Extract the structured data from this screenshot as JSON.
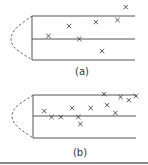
{
  "chart_data": [
    {
      "type": "scatter",
      "label": "(a)",
      "description": "Points relative to a central band; y normalized so upper line = 1, center line = 0, lower line = -1; x normalized to band length (0..1)",
      "band_lines": [
        1,
        0,
        -1
      ],
      "marker": "x",
      "points": [
        {
          "x": 0.91,
          "y": 1.45
        },
        {
          "x": 0.36,
          "y": 0.59
        },
        {
          "x": 0.62,
          "y": 0.77
        },
        {
          "x": 0.83,
          "y": 0.86
        },
        {
          "x": 0.16,
          "y": 0.14
        },
        {
          "x": 0.46,
          "y": 0.0
        },
        {
          "x": 0.68,
          "y": -0.55
        }
      ],
      "distribution_curve": "dashed triangular/Gaussian-like profile on the left, spanning from upper line to lower line, peaked at center line"
    },
    {
      "type": "scatter",
      "label": "(b)",
      "description": "Points relative to a central band; y normalized so upper line = 1, center line = 0, lower line = -1; x normalized to band length (0..1)",
      "band_lines": [
        1,
        0,
        -1
      ],
      "marker": "x",
      "points": [
        {
          "x": 0.69,
          "y": 1.02
        },
        {
          "x": 0.85,
          "y": 0.88
        },
        {
          "x": 0.93,
          "y": 0.74
        },
        {
          "x": 1.0,
          "y": 0.93
        },
        {
          "x": 0.11,
          "y": 0.23
        },
        {
          "x": 0.38,
          "y": 0.37
        },
        {
          "x": 0.56,
          "y": 0.37
        },
        {
          "x": 0.72,
          "y": 0.51
        },
        {
          "x": 0.18,
          "y": -0.05
        },
        {
          "x": 0.27,
          "y": -0.05
        },
        {
          "x": 0.44,
          "y": -0.05
        },
        {
          "x": 0.8,
          "y": 0.14
        },
        {
          "x": 0.46,
          "y": -0.37
        }
      ],
      "distribution_curve": "dashed triangular/Gaussian-like profile on the left, spanning from upper line to lower line, peaked at center line"
    }
  ],
  "colors": {
    "lines": "#555555",
    "markers": "#444444",
    "curve": "#666666",
    "background": "#ffffff"
  }
}
